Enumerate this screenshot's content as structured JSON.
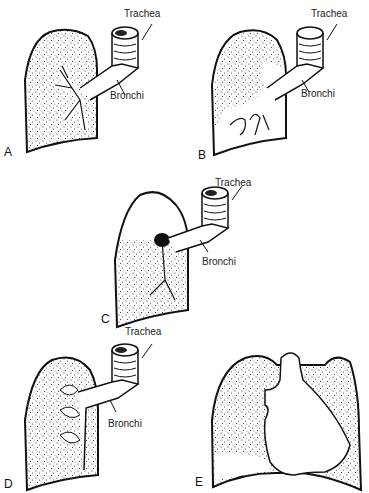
{
  "figure": {
    "panels": [
      {
        "id": "A",
        "letter": "A",
        "trachea_label": "Trachea",
        "bronchi_label": "Bronchi"
      },
      {
        "id": "B",
        "letter": "B",
        "trachea_label": "Trachea",
        "bronchi_label": "Bronchi"
      },
      {
        "id": "C",
        "letter": "C",
        "trachea_label": "Trachea",
        "bronchi_label": "Bronchi"
      },
      {
        "id": "D",
        "letter": "D",
        "trachea_label": "Trachea",
        "bronchi_label": "Bronchi"
      },
      {
        "id": "E",
        "letter": "E"
      }
    ]
  }
}
